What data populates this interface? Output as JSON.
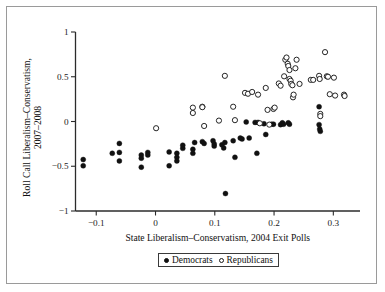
{
  "figure": {
    "background_color": "#ffffff",
    "frame_color": "#9a9a9a",
    "ink_color": "#111111"
  },
  "chart_data": {
    "type": "scatter",
    "title": "",
    "xlabel": "State Liberalism–Conservatism, 2004 Exit Polls",
    "ylabel": "Roll Call Liberalism–Conservatism, 2007–2008",
    "xlim": [
      -0.135,
      0.345
    ],
    "ylim": [
      -1,
      1
    ],
    "xticks": [
      -0.1,
      0,
      0.1,
      0.2,
      0.3
    ],
    "xticklabels": [
      "−0.1",
      "0",
      "0.1",
      "0.2",
      "0.3"
    ],
    "yticks": [
      -1,
      -0.5,
      0,
      0.5,
      1
    ],
    "yticklabels": [
      "−1",
      "−0.5",
      "0",
      "0.5",
      "1"
    ],
    "grid": false,
    "legend_position": "below-axis-centered",
    "series": [
      {
        "name": "Democrats",
        "marker": "filled-circle",
        "color": "#111111",
        "points": [
          [
            -0.122,
            -0.425
          ],
          [
            -0.122,
            -0.495
          ],
          [
            -0.073,
            -0.355
          ],
          [
            -0.061,
            -0.245
          ],
          [
            -0.061,
            -0.345
          ],
          [
            -0.061,
            -0.44
          ],
          [
            -0.024,
            -0.375
          ],
          [
            -0.024,
            -0.41
          ],
          [
            -0.024,
            -0.51
          ],
          [
            -0.013,
            -0.345
          ],
          [
            -0.013,
            -0.375
          ],
          [
            0.023,
            -0.34
          ],
          [
            0.023,
            -0.495
          ],
          [
            0.036,
            -0.355
          ],
          [
            0.036,
            -0.4
          ],
          [
            0.036,
            -0.44
          ],
          [
            0.046,
            -0.3
          ],
          [
            0.046,
            -0.265
          ],
          [
            0.063,
            -0.31
          ],
          [
            0.063,
            -0.355
          ],
          [
            0.066,
            -0.235
          ],
          [
            0.079,
            -0.225
          ],
          [
            0.082,
            -0.245
          ],
          [
            0.097,
            -0.215
          ],
          [
            0.099,
            -0.25
          ],
          [
            0.099,
            -0.275
          ],
          [
            0.112,
            -0.26
          ],
          [
            0.115,
            -0.295
          ],
          [
            0.117,
            -0.235
          ],
          [
            0.118,
            -0.805
          ],
          [
            0.131,
            -0.215
          ],
          [
            0.134,
            -0.4
          ],
          [
            0.143,
            -0.185
          ],
          [
            0.146,
            -0.195
          ],
          [
            0.153,
            -0.005
          ],
          [
            0.158,
            -0.185
          ],
          [
            0.168,
            -0.01
          ],
          [
            0.171,
            -0.355
          ],
          [
            0.173,
            -0.01
          ],
          [
            0.183,
            -0.025
          ],
          [
            0.186,
            -0.145
          ],
          [
            0.196,
            -0.03
          ],
          [
            0.199,
            -0.03
          ],
          [
            0.211,
            -0.035
          ],
          [
            0.214,
            -0.015
          ],
          [
            0.216,
            -0.03
          ],
          [
            0.224,
            -0.015
          ],
          [
            0.226,
            -0.03
          ],
          [
            0.276,
            0.165
          ],
          [
            0.276,
            -0.035
          ],
          [
            0.277,
            -0.085
          ],
          [
            0.278,
            -0.11
          ]
        ]
      },
      {
        "name": "Republicans",
        "marker": "open-circle",
        "color": "#ffffff",
        "points": [
          [
            0.001,
            -0.075
          ],
          [
            0.063,
            0.155
          ],
          [
            0.063,
            0.095
          ],
          [
            0.079,
            0.165
          ],
          [
            0.079,
            0.16
          ],
          [
            0.082,
            -0.05
          ],
          [
            0.107,
            0.01
          ],
          [
            0.117,
            0.51
          ],
          [
            0.131,
            0.165
          ],
          [
            0.134,
            0.015
          ],
          [
            0.151,
            0.32
          ],
          [
            0.156,
            0.31
          ],
          [
            0.163,
            0.33
          ],
          [
            0.173,
            0.3
          ],
          [
            0.176,
            -0.02
          ],
          [
            0.186,
            0.375
          ],
          [
            0.189,
            0.13
          ],
          [
            0.192,
            -0.035
          ],
          [
            0.199,
            0.14
          ],
          [
            0.201,
            0.155
          ],
          [
            0.208,
            0.425
          ],
          [
            0.211,
            0.4
          ],
          [
            0.217,
            0.505
          ],
          [
            0.219,
            0.69
          ],
          [
            0.221,
            0.715
          ],
          [
            0.223,
            0.645
          ],
          [
            0.224,
            0.62
          ],
          [
            0.226,
            0.575
          ],
          [
            0.226,
            0.475
          ],
          [
            0.228,
            0.455
          ],
          [
            0.229,
            0.42
          ],
          [
            0.231,
            0.405
          ],
          [
            0.232,
            0.27
          ],
          [
            0.233,
            0.3
          ],
          [
            0.236,
            0.595
          ],
          [
            0.238,
            0.69
          ],
          [
            0.243,
            0.42
          ],
          [
            0.262,
            0.465
          ],
          [
            0.266,
            0.465
          ],
          [
            0.276,
            0.51
          ],
          [
            0.277,
            0.475
          ],
          [
            0.278,
            0.085
          ],
          [
            0.278,
            0.06
          ],
          [
            0.286,
            0.775
          ],
          [
            0.289,
            0.505
          ],
          [
            0.291,
            0.5
          ],
          [
            0.294,
            0.305
          ],
          [
            0.301,
            0.49
          ],
          [
            0.303,
            0.29
          ],
          [
            0.318,
            0.3
          ],
          [
            0.319,
            0.285
          ]
        ]
      }
    ],
    "legend": [
      {
        "label": "Democrats",
        "marker": "filled-circle"
      },
      {
        "label": "Republicans",
        "marker": "open-circle"
      }
    ]
  }
}
